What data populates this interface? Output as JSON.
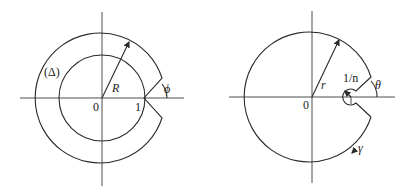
{
  "figures": [
    {
      "id": "left",
      "labels": {
        "region": "(Δ)",
        "radius": "R",
        "origin": "0",
        "unit": "1",
        "angle": "ϕ"
      }
    },
    {
      "id": "right",
      "labels": {
        "radius": "r",
        "small_radius": "1/n",
        "origin": "0",
        "angle": "θ",
        "contour": "γ"
      }
    }
  ],
  "colors": {
    "stroke": "#2a2a2a",
    "background": "#ffffff"
  }
}
